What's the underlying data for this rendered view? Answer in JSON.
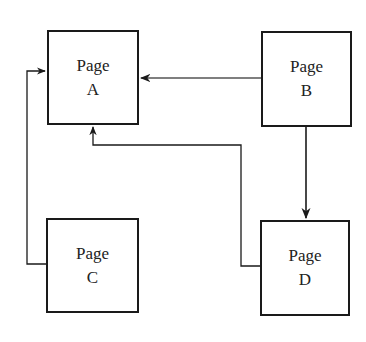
{
  "diagram": {
    "nodes": [
      {
        "id": "A",
        "line1": "Page",
        "line2": "A",
        "x": 47,
        "y": 30,
        "w": 92,
        "h": 95
      },
      {
        "id": "B",
        "line1": "Page",
        "line2": "B",
        "x": 261,
        "y": 31,
        "w": 91,
        "h": 96
      },
      {
        "id": "C",
        "line1": "Page",
        "line2": "C",
        "x": 46,
        "y": 218,
        "w": 93,
        "h": 95
      },
      {
        "id": "D",
        "line1": "Page",
        "line2": "D",
        "x": 260,
        "y": 220,
        "w": 90,
        "h": 96
      }
    ],
    "edges": [
      {
        "from": "B",
        "to": "A",
        "label": ""
      },
      {
        "from": "B",
        "to": "D",
        "label": ""
      },
      {
        "from": "C",
        "to": "A",
        "label": ""
      },
      {
        "from": "D",
        "to": "A",
        "label": ""
      }
    ],
    "colors": {
      "stroke": "#1a1a1a",
      "text": "#222222",
      "background": "#ffffff"
    }
  }
}
